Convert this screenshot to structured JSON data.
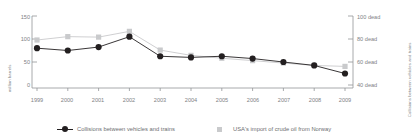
{
  "chart_data": {
    "type": "line",
    "title": "",
    "xlabel": "",
    "ylabel": "million barrels",
    "ylabel_right": "Collisions between vehicles and trains",
    "grid": false,
    "legend_position": "bottom",
    "categories": [
      "1999",
      "2000",
      "2001",
      "2002",
      "2003",
      "2004",
      "2005",
      "2006",
      "2007",
      "2008",
      "2009"
    ],
    "ylim": [
      0,
      150
    ],
    "yticks": [
      "0",
      "50",
      "100",
      "150"
    ],
    "ylim_right": [
      30,
      110
    ],
    "yticks_right": [
      "40 dead",
      "60 dead",
      "80 dead",
      "100 dead"
    ],
    "series": [
      {
        "name": "Collisions between vehicles and trains",
        "axis": "right",
        "color": "#231f20",
        "marker": "circle",
        "values": [
          72,
          70,
          73,
          82,
          65,
          64,
          65,
          63,
          60,
          57,
          50
        ]
      },
      {
        "name": "USA's import of crude oil from Norway",
        "axis": "left",
        "color": "#c9cacc",
        "marker": "square",
        "values": [
          100,
          107,
          106,
          118,
          79,
          68,
          62,
          57,
          52,
          47,
          45
        ]
      }
    ]
  },
  "axes": {
    "left_title": "million barrels",
    "right_title": "Collisions between vehicles and trains",
    "left_ticks": [
      "150",
      "100",
      "50",
      "0"
    ],
    "right_ticks": [
      "100 dead",
      "80 dead",
      "60 dead",
      "40 dead"
    ],
    "x_ticks": [
      "1999",
      "2000",
      "2001",
      "2002",
      "2003",
      "2004",
      "2005",
      "2006",
      "2007",
      "2008",
      "2009"
    ]
  },
  "legend": {
    "items": [
      {
        "label": "Collisions between vehicles and trains",
        "marker": "line-circle-marker",
        "color": "#231f20"
      },
      {
        "label": "USA's import of crude oil from Norway",
        "marker": "square-marker",
        "color": "#c9cacc"
      }
    ]
  },
  "colors": {
    "dark_series": "#231f20",
    "light_series": "#c9cacc",
    "axis": "#939598",
    "text": "#808285"
  }
}
